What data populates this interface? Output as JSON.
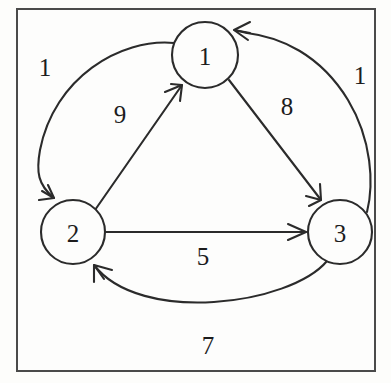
{
  "diagram": {
    "type": "directed-graph",
    "frame": {
      "border_color": "#4a4a4a",
      "background_color": "#fdfdfc"
    },
    "stroke_color": "#2b2b2b",
    "nodes": [
      {
        "id": "1",
        "label": "1",
        "cx": 205,
        "cy": 55,
        "r": 33
      },
      {
        "id": "2",
        "label": "2",
        "cx": 73,
        "cy": 232,
        "r": 32
      },
      {
        "id": "3",
        "label": "3",
        "cx": 340,
        "cy": 232,
        "r": 32
      }
    ],
    "edges": [
      {
        "id": "e-1-2",
        "from": "1",
        "to": "2",
        "weight": "1",
        "shape": "arc-left",
        "label_x": 45,
        "label_y": 68
      },
      {
        "id": "e-3-1",
        "from": "3",
        "to": "1",
        "weight": "1",
        "shape": "arc-right",
        "label_x": 360,
        "label_y": 76
      },
      {
        "id": "e-2-1",
        "from": "2",
        "to": "1",
        "weight": "9",
        "shape": "straight",
        "label_x": 120,
        "label_y": 115
      },
      {
        "id": "e-1-3",
        "from": "1",
        "to": "3",
        "weight": "8",
        "shape": "straight",
        "label_x": 287,
        "label_y": 107
      },
      {
        "id": "e-2-3",
        "from": "2",
        "to": "3",
        "weight": "5",
        "shape": "straight",
        "label_x": 203,
        "label_y": 257
      },
      {
        "id": "e-3-2",
        "from": "3",
        "to": "2",
        "weight": "7",
        "shape": "arc-bottom",
        "label_x": 208,
        "label_y": 346
      }
    ]
  }
}
